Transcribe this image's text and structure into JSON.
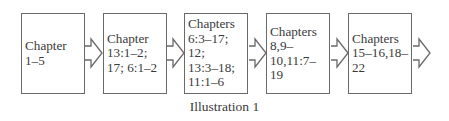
{
  "diagram": {
    "type": "flow",
    "direction": "left-to-right",
    "boxes": [
      {
        "id": "box-1",
        "text": "Chapter\n1–5"
      },
      {
        "id": "box-2",
        "text": "Chapter\n13:1–2;\n17; 6:1–2"
      },
      {
        "id": "box-3",
        "text": "Chapters\n6:3–17; 12;\n13:3–18;\n11:1–6"
      },
      {
        "id": "box-4",
        "text": "Chapters\n8,9–\n10,11:7–\n19"
      },
      {
        "id": "box-5",
        "text": "Chapters\n15–16,18–\n22"
      }
    ],
    "arrows": [
      {
        "from": "box-1",
        "to": "box-2",
        "style": "hollow-block-arrow"
      },
      {
        "from": "box-2",
        "to": "box-3",
        "style": "hollow-block-arrow"
      },
      {
        "from": "box-3",
        "to": "box-4",
        "style": "hollow-block-arrow"
      },
      {
        "from": "box-4",
        "to": "box-5",
        "style": "hollow-block-arrow"
      },
      {
        "from": "box-5",
        "to": null,
        "style": "hollow-block-arrow"
      }
    ],
    "caption": "Illustration 1",
    "colors": {
      "stroke": "#6a6a6a",
      "text": "#3a3a3a",
      "background": "#ffffff"
    }
  }
}
